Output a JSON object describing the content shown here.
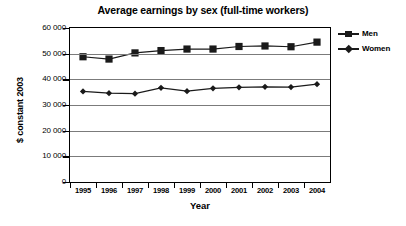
{
  "chart_data": {
    "type": "line",
    "title": "Average earnings by sex (full-time workers)",
    "xlabel": "Year",
    "ylabel": "$ constant 2003",
    "categories": [
      "1995",
      "1996",
      "1997",
      "1998",
      "1999",
      "2000",
      "2001",
      "2002",
      "2003",
      "2004"
    ],
    "series": [
      {
        "name": "Men",
        "marker": "square",
        "values": [
          48800,
          47900,
          50300,
          51200,
          51800,
          51800,
          52800,
          53000,
          52700,
          54500
        ]
      },
      {
        "name": "Women",
        "marker": "diamond",
        "values": [
          35300,
          34600,
          34400,
          36700,
          35400,
          36500,
          36900,
          37100,
          37000,
          38100
        ]
      }
    ],
    "ylim": [
      0,
      60000
    ],
    "y_ticks": [
      0,
      10000,
      20000,
      30000,
      40000,
      50000,
      60000
    ],
    "y_tick_labels": [
      "0",
      "10 000",
      "20 000",
      "30 000",
      "40 000",
      "50 000",
      "60 000"
    ],
    "grid": true,
    "legend_position": "right",
    "colors": {
      "series_line": "#1a1a1a",
      "grid": "#7b7b7b",
      "axis": "#000000",
      "background": "#ffffff"
    }
  },
  "legend": {
    "items": [
      {
        "label": "Men"
      },
      {
        "label": "Women"
      }
    ]
  }
}
